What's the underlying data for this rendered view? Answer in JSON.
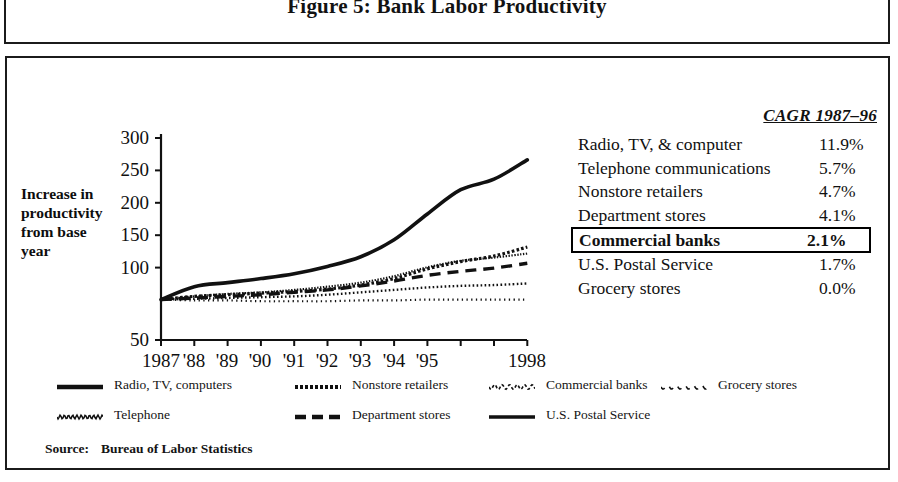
{
  "figure": {
    "title": "Figure 5:  Bank Labor Productivity",
    "source_label": "Source:",
    "source_text": "Bureau of Labor Statistics"
  },
  "axis": {
    "y_title": "Increase in productivity from base year",
    "y_ticks": [
      "300",
      "250",
      "200",
      "150",
      "100",
      "50"
    ],
    "x_ticks": [
      "1987",
      "'88",
      "'89",
      "'90",
      "'91",
      "'92",
      "'93",
      "'94",
      "'95",
      "1998"
    ]
  },
  "cagr": {
    "header": "CAGR 1987–96",
    "rows": [
      {
        "name": "Radio, TV, & computer",
        "value": "11.9%",
        "highlight": false
      },
      {
        "name": "Telephone communications",
        "value": "5.7%",
        "highlight": false
      },
      {
        "name": "Nonstore retailers",
        "value": "4.7%",
        "highlight": false
      },
      {
        "name": "Department stores",
        "value": "4.1%",
        "highlight": false
      },
      {
        "name": "Commercial banks",
        "value": "2.1%",
        "highlight": true
      },
      {
        "name": "U.S. Postal Service",
        "value": "1.7%",
        "highlight": false
      },
      {
        "name": "Grocery stores",
        "value": "0.0%",
        "highlight": false
      }
    ]
  },
  "legend": {
    "rows": [
      [
        {
          "label": "Radio, TV, computers",
          "style": "solid-thick"
        },
        {
          "label": "Nonstore retailers",
          "style": "dotted-thick"
        },
        {
          "label": "Commercial banks",
          "style": "wave-sparse"
        },
        {
          "label": "Grocery stores",
          "style": "wave-gap"
        }
      ],
      [
        {
          "label": "Telephone",
          "style": "wave-fine"
        },
        {
          "label": "Department stores",
          "style": "dashed"
        },
        {
          "label": "U.S. Postal Service",
          "style": "solid-med"
        }
      ]
    ]
  },
  "colors": {
    "ink": "#111111",
    "frame": "#1b1b1b",
    "paper": "#ffffff"
  },
  "chart_data": {
    "type": "line",
    "title": "Figure 5:  Bank Labor Productivity",
    "xlabel": "",
    "ylabel": "Increase in productivity from base year",
    "xlim": [
      1987,
      1998
    ],
    "ylim": [
      50,
      300
    ],
    "ytick_values": [
      50,
      100,
      150,
      200,
      250,
      300
    ],
    "grid": false,
    "legend_position": "bottom",
    "x": [
      1987,
      1988,
      1989,
      1990,
      1991,
      1992,
      1993,
      1994,
      1995,
      1996,
      1997,
      1998
    ],
    "series": [
      {
        "name": "Radio, TV, computers",
        "style": "solid-thick",
        "cagr": 11.9,
        "values": [
          100,
          116,
          121,
          126,
          132,
          141,
          153,
          174,
          206,
          236,
          249,
          273
        ]
      },
      {
        "name": "Nonstore retailers",
        "style": "dotted-thick",
        "cagr": 4.7,
        "values": [
          100,
          104,
          106,
          108,
          110,
          113,
          118,
          126,
          138,
          147,
          154,
          165
        ]
      },
      {
        "name": "Telephone communications",
        "style": "wave-fine",
        "cagr": 5.7,
        "values": [
          100,
          104,
          107,
          109,
          112,
          116,
          121,
          129,
          140,
          148,
          152,
          157
        ]
      },
      {
        "name": "Department stores",
        "style": "dashed",
        "cagr": 4.1,
        "values": [
          100,
          102,
          104,
          106,
          109,
          112,
          117,
          123,
          130,
          135,
          139,
          145
        ]
      },
      {
        "name": "Commercial banks",
        "style": "wave-sparse",
        "cagr": 2.1,
        "values": [
          100,
          101,
          102,
          103,
          104,
          106,
          109,
          112,
          115,
          117,
          118,
          120
        ]
      },
      {
        "name": "U.S. Postal Service",
        "style": "solid-med",
        "cagr": 1.7,
        "values": [
          100,
          100,
          101,
          101,
          102,
          103,
          105,
          107,
          110,
          112,
          113,
          115
        ]
      },
      {
        "name": "Grocery stores",
        "style": "wave-gap",
        "cagr": 0.0,
        "values": [
          100,
          99,
          99,
          98,
          98,
          98,
          99,
          99,
          100,
          100,
          100,
          100
        ]
      }
    ]
  }
}
